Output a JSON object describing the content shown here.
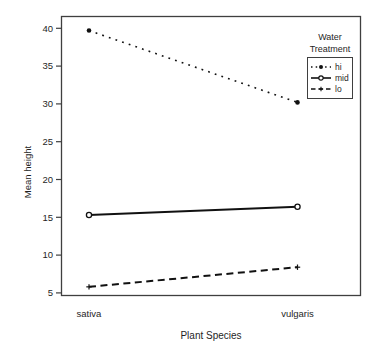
{
  "figure": {
    "background": "#ffffff",
    "line_color": "#111111",
    "text_color": "#1f1f1f",
    "box_color": "#3f3f3f"
  },
  "chart_data": {
    "type": "line",
    "title": "",
    "xlabel": "Plant Species",
    "ylabel": "Mean height",
    "categories": [
      "sativa",
      "vulgaris"
    ],
    "series": [
      {
        "name": "hi",
        "values": [
          39.7,
          30.2
        ],
        "linestyle": "dotted",
        "marker": "filled-circle"
      },
      {
        "name": "mid",
        "values": [
          15.3,
          16.4
        ],
        "linestyle": "solid",
        "marker": "open-circle"
      },
      {
        "name": "lo",
        "values": [
          5.8,
          8.4
        ],
        "linestyle": "dashed",
        "marker": "plus"
      }
    ],
    "yticks": [
      5,
      10,
      15,
      20,
      25,
      30,
      35,
      40
    ],
    "ylim": [
      4.7,
      41.8
    ],
    "grid": false,
    "legend": {
      "title": "Water Treatment",
      "position": "top-right",
      "entries": [
        "hi",
        "mid",
        "lo"
      ]
    }
  }
}
